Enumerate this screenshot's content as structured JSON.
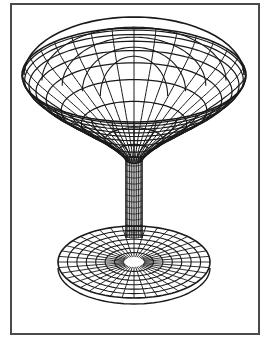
{
  "figure": {
    "colors": {
      "background": "#ffffff",
      "frame": "#4a4a4a",
      "wire": "#1a1a1a"
    },
    "frame": {
      "x": 10,
      "y": 3,
      "width": 248,
      "height": 330
    },
    "bowl": {
      "cx": 134,
      "rim_rx": 112,
      "rim_ry": 58,
      "rim_cy": 70,
      "meridians": 32,
      "parallels": 9
    },
    "stem": {
      "cx": 134,
      "top_y": 158,
      "bottom_y": 238,
      "half_width": 8,
      "lines": 10
    },
    "base": {
      "cx": 134,
      "cy": 262,
      "rx": 76,
      "ry": 36,
      "rings": 7,
      "spokes": 40
    }
  }
}
